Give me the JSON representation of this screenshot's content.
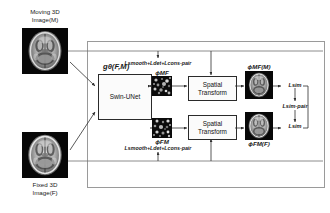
{
  "figure": {
    "type": "architecture-diagram",
    "topic": "Swin-UNet based deformable medical image registration"
  },
  "inputs": {
    "moving": {
      "line1": "Moving 3D",
      "line2": "Image(M)",
      "image_name": "moving-brain-mri"
    },
    "fixed": {
      "line1": "Fixed 3D",
      "line2": "Image(F)",
      "image_name": "fixed-brain-mri"
    }
  },
  "network": {
    "function_label": "gθ(F,M)",
    "box_label": "Swin-UNet"
  },
  "fields": {
    "forward": {
      "symbol": "ϕMF",
      "loss": "Lsmooth+Ldet+Lcons-pair",
      "image_name": "deformation-field-mf"
    },
    "backward": {
      "symbol": "ϕFM",
      "loss": "Lsmooth+Ldet+Lcons-pair",
      "image_name": "deformation-field-fm"
    }
  },
  "transforms": {
    "top": {
      "line1": "Spatial",
      "line2": "Transform"
    },
    "bottom": {
      "line1": "Spatial",
      "line2": "Transform"
    }
  },
  "warped": {
    "top": {
      "symbol": "ϕMF(M)",
      "image_name": "warped-moving-brain"
    },
    "bottom": {
      "symbol": "ϕFM(F)",
      "image_name": "warped-fixed-brain"
    }
  },
  "losses": {
    "top": "Lsim",
    "middle": "Lsim-pair",
    "bottom": "Lsim"
  },
  "colors": {
    "stroke": "#2f2f2f",
    "frame": "#9a9a9a",
    "box_fill": "#fbfbfb",
    "text": "#1a1a1a",
    "brain_bg": "#050505"
  }
}
